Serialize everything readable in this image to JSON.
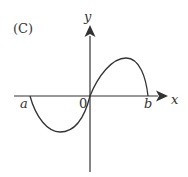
{
  "figure": {
    "label": "(C)",
    "y_axis_label": "y",
    "x_axis_label": "x",
    "origin_label": "0",
    "point_a_label": "a",
    "point_b_label": "b",
    "stroke_color": "#333333"
  }
}
